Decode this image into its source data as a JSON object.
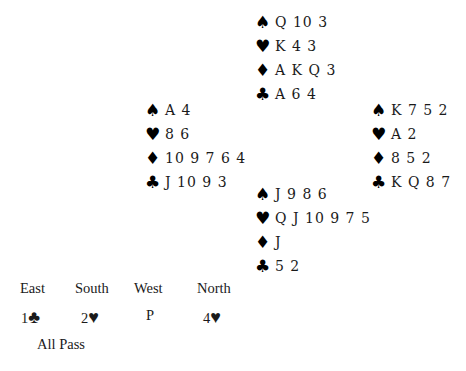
{
  "hands": {
    "north": {
      "spades": "Q 10 3",
      "hearts": "K 4 3",
      "diamonds": "A K Q 3",
      "clubs": "A 6 4"
    },
    "west": {
      "spades": "A 4",
      "hearts": "8 6",
      "diamonds": "10 9 7 6 4",
      "clubs": "J 10 9 3"
    },
    "east": {
      "spades": "K 7 5 2",
      "hearts": "A 2",
      "diamonds": "8 5 2",
      "clubs": "K Q 8 7"
    },
    "south": {
      "spades": "J 9 8 6",
      "hearts": "Q J 10 9 7 5",
      "diamonds": "J",
      "clubs": "5 2"
    }
  },
  "suit_icons": {
    "spades": "♠",
    "hearts": "♥",
    "diamonds": "♦",
    "clubs": "♣"
  },
  "auction": {
    "headers": [
      "East",
      "South",
      "West",
      "North"
    ],
    "bids": [
      {
        "level": "1",
        "suit": "♣"
      },
      {
        "level": "2",
        "suit": "♥"
      },
      {
        "level": "P",
        "suit": ""
      },
      {
        "level": "4",
        "suit": "♥"
      }
    ],
    "final": "All Pass"
  }
}
